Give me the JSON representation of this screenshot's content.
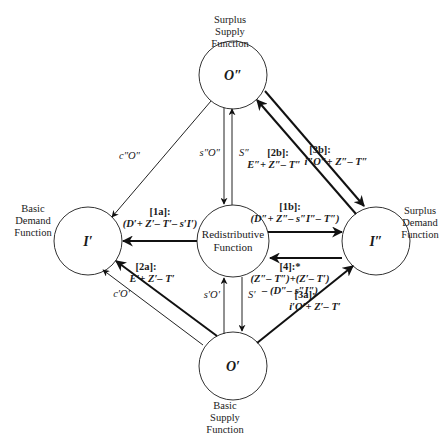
{
  "nodes": {
    "surplus_supply": {
      "symbol": "O″",
      "caption": [
        "Surplus",
        "Supply",
        "Function"
      ]
    },
    "basic_demand": {
      "symbol": "I′",
      "caption": [
        "Basic",
        "Demand",
        "Function"
      ]
    },
    "redistributive": {
      "symbol": "",
      "caption": [
        "Redistributive",
        "Function"
      ]
    },
    "surplus_demand": {
      "symbol": "I″",
      "caption": [
        "Surplus",
        "Demand",
        "Function"
      ]
    },
    "basic_supply": {
      "symbol": "O′",
      "caption": [
        "Basic",
        "Supply",
        "Function"
      ]
    }
  },
  "edges": {
    "c2o2": {
      "label": "c″O″"
    },
    "s2o2": {
      "label": "s″O″"
    },
    "s2": {
      "label": "S″"
    },
    "e2b": {
      "tag": "[2b]:",
      "expr": "E″+ Z″– T″"
    },
    "e3b": {
      "tag": "[3b]:",
      "expr": "i″O″+ Z″– T″"
    },
    "e1a": {
      "tag": "[1a]:",
      "expr": "(D′+ Z′– T′– s′I′)"
    },
    "e1b": {
      "tag": "[1b]:",
      "expr": "(D″+ Z″– s″I″– T″)"
    },
    "e4": {
      "tag": "[4]:*",
      "expr1": "(Z″– T″)+(Z′– T′)",
      "expr2": "– (D″– s″I″)"
    },
    "e2a": {
      "tag": "[2a]:",
      "expr": "E′+ Z′– T′"
    },
    "c1o1": {
      "label": "c′O′"
    },
    "s1o1": {
      "label": "s′O′"
    },
    "s1": {
      "label": "S′"
    },
    "e3a": {
      "tag": "[3a]:",
      "expr": "i′O′+ Z′– T′"
    }
  }
}
